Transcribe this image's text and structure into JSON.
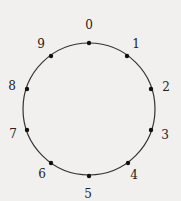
{
  "diagram": {
    "type": "circle-with-labeled-points",
    "center": [
      89,
      109
    ],
    "radius": 66,
    "colors": {
      "background": "#f2f0ee",
      "stroke": "#333333",
      "point": "#111111",
      "label": "#222222"
    },
    "points": [
      {
        "label": "0",
        "x": 89,
        "y": 43,
        "lx": 89,
        "ly": 25
      },
      {
        "label": "1",
        "x": 127,
        "y": 56,
        "lx": 136,
        "ly": 44
      },
      {
        "label": "2",
        "x": 151,
        "y": 89,
        "lx": 166,
        "ly": 87
      },
      {
        "label": "3",
        "x": 151,
        "y": 130,
        "lx": 165,
        "ly": 135
      },
      {
        "label": "4",
        "x": 128,
        "y": 163,
        "lx": 134,
        "ly": 175
      },
      {
        "label": "5",
        "x": 89,
        "y": 176,
        "lx": 88,
        "ly": 194
      },
      {
        "label": "6",
        "x": 51,
        "y": 163,
        "lx": 42,
        "ly": 174
      },
      {
        "label": "7",
        "x": 27,
        "y": 130,
        "lx": 13,
        "ly": 134
      },
      {
        "label": "8",
        "x": 27,
        "y": 89,
        "lx": 12,
        "ly": 86
      },
      {
        "label": "9",
        "x": 51,
        "y": 56,
        "lx": 41,
        "ly": 44
      }
    ]
  }
}
